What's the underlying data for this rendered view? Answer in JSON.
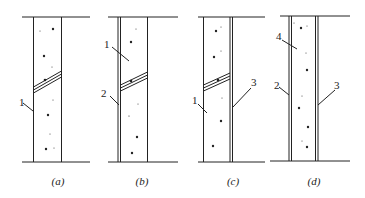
{
  "figure": {
    "panels": [
      {
        "id": "a",
        "caption": "(a)",
        "labels": [
          {
            "text": "1",
            "x": 21,
            "y": 106
          }
        ]
      },
      {
        "id": "b",
        "caption": "(b)",
        "labels": [
          {
            "text": "1",
            "x": 108,
            "y": 48
          },
          {
            "text": "2",
            "x": 105,
            "y": 97
          }
        ]
      },
      {
        "id": "c",
        "caption": "(c)",
        "labels": [
          {
            "text": "1",
            "x": 194,
            "y": 103
          },
          {
            "text": "3",
            "x": 251,
            "y": 85
          }
        ]
      },
      {
        "id": "d",
        "caption": "(d)",
        "labels": [
          {
            "text": "4",
            "x": 276,
            "y": 40
          },
          {
            "text": "2",
            "x": 275,
            "y": 89
          },
          {
            "text": "3",
            "x": 334,
            "y": 90
          }
        ]
      }
    ],
    "colors": {
      "line": "#222222",
      "background": "#ffffff"
    }
  }
}
